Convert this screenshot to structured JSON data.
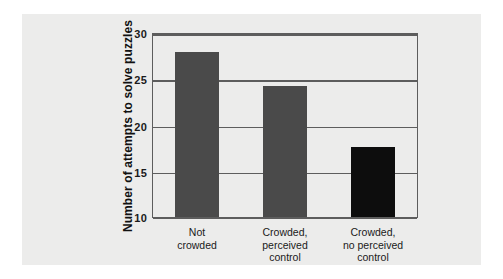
{
  "chart_data": {
    "type": "bar",
    "title": "",
    "xlabel": "",
    "ylabel": "Number of attempts to solve puzzles",
    "categories": [
      "Not\ncrowded",
      "Crowded,\nperceived\ncontrol",
      "Crowded,\nno perceived\ncontrol"
    ],
    "values": [
      28.0,
      24.3,
      17.6
    ],
    "bar_colors": [
      "#4a4a4a",
      "#4a4a4a",
      "#0d0d0d"
    ],
    "ylim": [
      10,
      30
    ],
    "yticks": [
      10,
      15,
      20,
      25,
      30
    ],
    "ytick_labels": [
      "10",
      "15",
      "20",
      "25",
      "30"
    ],
    "grid": true,
    "grid_axis": "y",
    "legend": null,
    "annotations": []
  },
  "figure": {
    "background_color": "#ececeb",
    "page_background_color": "#ffffff",
    "axis_color": "#5d5d5d"
  }
}
